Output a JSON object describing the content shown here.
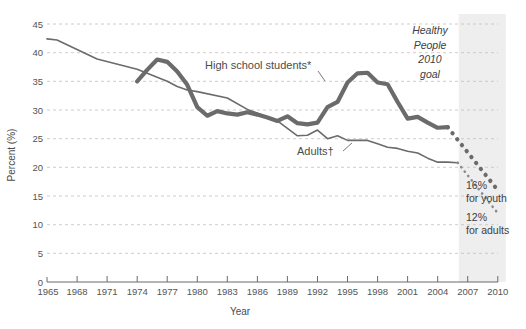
{
  "chart_data": {
    "type": "line",
    "title": "",
    "xlabel": "Year",
    "ylabel": "Percent (%)",
    "xlim": [
      1965,
      2010
    ],
    "ylim": [
      0,
      45
    ],
    "ytick_values": [
      0,
      5,
      10,
      15,
      20,
      25,
      30,
      35,
      40,
      45
    ],
    "ytick_labels": [
      "0",
      "5",
      "10",
      "15",
      "20",
      "25",
      "30",
      "35",
      "40",
      "45"
    ],
    "xtick_values": [
      1965,
      1968,
      1971,
      1974,
      1977,
      1980,
      1983,
      1986,
      1989,
      1992,
      1995,
      1998,
      2001,
      2004,
      2007,
      2010
    ],
    "xtick_labels": [
      "1965",
      "1968",
      "1971",
      "1974",
      "1977",
      "1980",
      "1983",
      "1986",
      "1989",
      "1992",
      "1995",
      "1998",
      "2001",
      "2004",
      "2007",
      "2010"
    ],
    "grid": "horizontal-dashed",
    "legend": "inline-annotations",
    "series": [
      {
        "name": "High school students*",
        "style": "solid-thick",
        "color": "#6b6b6b",
        "x": [
          1974,
          1975,
          1976,
          1977,
          1978,
          1979,
          1980,
          1981,
          1982,
          1983,
          1984,
          1985,
          1986,
          1987,
          1988,
          1989,
          1990,
          1991,
          1992,
          1993,
          1994,
          1995,
          1996,
          1997,
          1998,
          1999,
          2000,
          2001,
          2002,
          2003,
          2004,
          2005
        ],
        "values": [
          35.0,
          37.0,
          38.8,
          38.4,
          36.7,
          34.4,
          30.5,
          29.0,
          29.8,
          29.4,
          29.2,
          29.6,
          29.2,
          28.7,
          28.1,
          28.9,
          27.7,
          27.5,
          27.8,
          30.5,
          31.4,
          34.8,
          36.4,
          36.5,
          34.8,
          34.5,
          31.4,
          28.5,
          28.8,
          27.8,
          26.9,
          27.0
        ]
      },
      {
        "name": "Adults†",
        "style": "solid-thin",
        "color": "#6b6b6b",
        "x": [
          1965,
          1966,
          1970,
          1974,
          1977,
          1978,
          1979,
          1980,
          1983,
          1985,
          1987,
          1988,
          1990,
          1991,
          1992,
          1993,
          1994,
          1995,
          1997,
          1998,
          1999,
          2000,
          2001,
          2002,
          2003,
          2004,
          2005,
          2006
        ],
        "values": [
          42.4,
          42.2,
          38.9,
          37.1,
          35.0,
          34.1,
          33.5,
          33.2,
          32.1,
          30.1,
          28.8,
          28.1,
          25.5,
          25.6,
          26.5,
          25.0,
          25.5,
          24.7,
          24.7,
          24.1,
          23.5,
          23.3,
          22.8,
          22.5,
          21.6,
          20.9,
          20.9,
          20.8
        ]
      },
      {
        "name": "Youth projection to 2010 goal",
        "style": "dotted-thick",
        "color": "#6b6b6b",
        "x": [
          2005,
          2010
        ],
        "values": [
          27.0,
          16.0
        ],
        "endpoint_label": [
          "16%",
          "for youth"
        ]
      },
      {
        "name": "Adults projection to 2010 goal",
        "style": "dotted-thin",
        "color": "#8a8a8a",
        "x": [
          2006,
          2010
        ],
        "values": [
          20.8,
          12.0
        ],
        "endpoint_label": [
          "12%",
          "for adults"
        ]
      }
    ],
    "shaded_region": {
      "label_lines": [
        "Healthy",
        "People",
        "2010",
        "goal"
      ],
      "x_start": 2006.1,
      "x_end": 2010.8,
      "color": "#eeeeee"
    },
    "annotations": [
      {
        "name": "high-school-students-label",
        "text": "High school students*",
        "x": 1988.5,
        "y": 36.6
      },
      {
        "name": "adults-label",
        "text": "Adults†",
        "x": 1997.0,
        "y": 21.6
      }
    ]
  }
}
